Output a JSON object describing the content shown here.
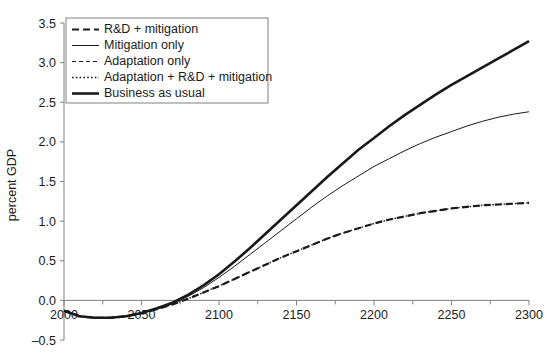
{
  "chart_data": {
    "type": "line",
    "title": "",
    "xlabel": "",
    "ylabel": "percent GDP",
    "xlim": [
      2000,
      2300
    ],
    "ylim": [
      -0.5,
      3.5
    ],
    "xticks": [
      2000,
      2050,
      2100,
      2150,
      2200,
      2250,
      2300
    ],
    "xtick_labels": [
      "2000",
      "2050",
      "2100",
      "2150",
      "2200",
      "2250",
      "2300"
    ],
    "xminor_step": 25,
    "yticks": [
      -0.5,
      0.0,
      0.5,
      1.0,
      1.5,
      2.0,
      2.5,
      3.0,
      3.5
    ],
    "ytick_labels": [
      "–0.5",
      "0.0",
      "0.5",
      "1.0",
      "1.5",
      "2.0",
      "2.5",
      "3.0",
      "3.5"
    ],
    "grid": false,
    "legend_position": "upper-left",
    "x": [
      2000,
      2010,
      2020,
      2030,
      2040,
      2050,
      2060,
      2070,
      2080,
      2090,
      2100,
      2110,
      2120,
      2130,
      2140,
      2150,
      2160,
      2170,
      2180,
      2190,
      2200,
      2210,
      2220,
      2230,
      2240,
      2250,
      2260,
      2270,
      2280,
      2290,
      2300
    ],
    "series": [
      {
        "name": "R&D + mitigation",
        "style": "dashed",
        "width": 2.2,
        "color": "#1a1a1a",
        "values": [
          -0.13,
          -0.2,
          -0.22,
          -0.22,
          -0.2,
          -0.16,
          -0.11,
          -0.05,
          0.02,
          0.1,
          0.18,
          0.27,
          0.36,
          0.45,
          0.54,
          0.62,
          0.7,
          0.78,
          0.85,
          0.91,
          0.97,
          1.02,
          1.06,
          1.1,
          1.13,
          1.16,
          1.18,
          1.2,
          1.21,
          1.22,
          1.23
        ]
      },
      {
        "name": "Mitigation only",
        "style": "solid-thin",
        "width": 1.0,
        "color": "#1a1a1a",
        "values": [
          -0.13,
          -0.2,
          -0.22,
          -0.22,
          -0.2,
          -0.16,
          -0.11,
          -0.04,
          0.05,
          0.16,
          0.29,
          0.43,
          0.58,
          0.73,
          0.88,
          1.03,
          1.18,
          1.32,
          1.45,
          1.57,
          1.69,
          1.79,
          1.89,
          1.98,
          2.06,
          2.13,
          2.2,
          2.26,
          2.31,
          2.35,
          2.38
        ]
      },
      {
        "name": "Adaptation only",
        "style": "dashed-small",
        "width": 1.2,
        "color": "#1a1a1a",
        "values": [
          -0.13,
          -0.2,
          -0.22,
          -0.22,
          -0.2,
          -0.16,
          -0.1,
          -0.03,
          0.07,
          0.19,
          0.33,
          0.49,
          0.66,
          0.84,
          1.02,
          1.2,
          1.38,
          1.56,
          1.73,
          1.9,
          2.05,
          2.2,
          2.34,
          2.47,
          2.6,
          2.72,
          2.83,
          2.94,
          3.05,
          3.16,
          3.27
        ]
      },
      {
        "name": "Adaptation + R&D + mitigation",
        "style": "dotted",
        "width": 1.4,
        "color": "#1a1a1a",
        "values": [
          -0.13,
          -0.2,
          -0.22,
          -0.22,
          -0.2,
          -0.16,
          -0.11,
          -0.05,
          0.02,
          0.1,
          0.18,
          0.27,
          0.36,
          0.45,
          0.54,
          0.62,
          0.7,
          0.78,
          0.85,
          0.91,
          0.97,
          1.02,
          1.06,
          1.1,
          1.13,
          1.16,
          1.18,
          1.2,
          1.21,
          1.22,
          1.23
        ]
      },
      {
        "name": "Business as usual",
        "style": "solid-thick",
        "width": 2.6,
        "color": "#1a1a1a",
        "values": [
          -0.13,
          -0.2,
          -0.22,
          -0.22,
          -0.2,
          -0.16,
          -0.1,
          -0.03,
          0.07,
          0.19,
          0.33,
          0.49,
          0.66,
          0.84,
          1.02,
          1.2,
          1.38,
          1.56,
          1.73,
          1.9,
          2.05,
          2.2,
          2.34,
          2.47,
          2.6,
          2.72,
          2.83,
          2.94,
          3.05,
          3.16,
          3.27
        ]
      }
    ]
  },
  "legend": {
    "entries": [
      {
        "label": "R&D + mitigation",
        "style": "dashed"
      },
      {
        "label": "Mitigation only",
        "style": "solid-thin"
      },
      {
        "label": "Adaptation only",
        "style": "dashed-small"
      },
      {
        "label": "Adaptation + R&D + mitigation",
        "style": "dotted"
      },
      {
        "label": "Business as usual",
        "style": "solid-thick"
      }
    ]
  }
}
